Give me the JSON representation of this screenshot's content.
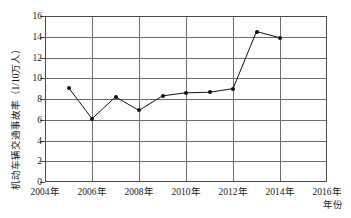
{
  "chart_data": {
    "type": "line",
    "title": "",
    "xlabel": "年份",
    "ylabel": "机动车辆交通事故率（1/10万人）",
    "xlim": [
      2004,
      2016
    ],
    "ylim": [
      0,
      16
    ],
    "grid": true,
    "legend": "none",
    "x_tick_labels": [
      "2004年",
      "2006年",
      "2008年",
      "2010年",
      "2012年",
      "2014年",
      "2016年"
    ],
    "x_tick_values": [
      2004,
      2006,
      2008,
      2010,
      2012,
      2014,
      2016
    ],
    "y_tick_labels": [
      "0",
      "2",
      "4",
      "6",
      "8",
      "10",
      "12",
      "14",
      "16"
    ],
    "y_tick_values": [
      0,
      2,
      4,
      6,
      8,
      10,
      12,
      14,
      16
    ],
    "series": [
      {
        "name": "机动车辆交通事故率",
        "marker": "filled-circle",
        "color": "#111111",
        "x": [
          2005,
          2006,
          2007,
          2008,
          2009,
          2010,
          2011,
          2012,
          2013,
          2014
        ],
        "values": [
          9.1,
          6.1,
          8.2,
          6.9,
          8.3,
          8.6,
          8.65,
          9.0,
          14.5,
          13.9
        ]
      }
    ]
  },
  "axis": {
    "y_title": "机动车辆交通事故率（1/10万人）",
    "x_title": "年份"
  }
}
